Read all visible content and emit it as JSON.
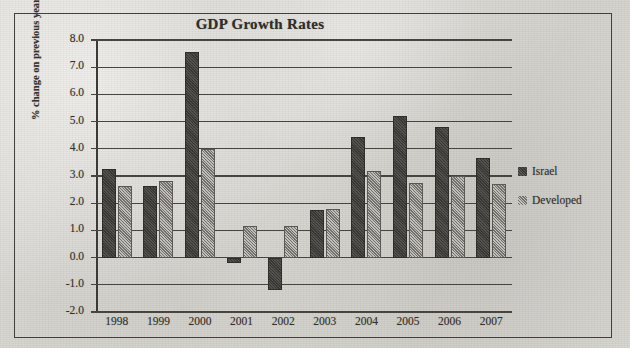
{
  "chart_data": {
    "type": "bar",
    "title": "GDP Growth Rates",
    "xlabel": "",
    "ylabel": "% change on previous year",
    "categories": [
      "1998",
      "1999",
      "2000",
      "2001",
      "2002",
      "2003",
      "2004",
      "2005",
      "2006",
      "2007"
    ],
    "series": [
      {
        "name": "Israel",
        "color": "#312f2b",
        "values": [
          3.25,
          2.65,
          7.55,
          -0.2,
          -1.2,
          1.75,
          4.45,
          5.2,
          4.8,
          3.65
        ]
      },
      {
        "name": "Developed",
        "color": "#8d8a84",
        "values": [
          2.65,
          2.8,
          4.0,
          1.15,
          1.15,
          1.8,
          3.2,
          2.75,
          3.0,
          2.7
        ]
      }
    ],
    "ylim": [
      -2.0,
      8.0
    ],
    "y_ticks": [
      "8.0",
      "7.0",
      "6.0",
      "5.0",
      "4.0",
      "3.0",
      "2.0",
      "1.0",
      "0.0",
      "-1.0",
      "-2.0"
    ],
    "y_tick_values": [
      8.0,
      7.0,
      6.0,
      5.0,
      4.0,
      3.0,
      2.0,
      1.0,
      0.0,
      -1.0,
      -2.0
    ],
    "grid": true,
    "legend_position": "right"
  },
  "legend": {
    "entries": [
      {
        "label": "Israel",
        "swatch": "legend-swatch-israel"
      },
      {
        "label": "Developed",
        "swatch": "legend-swatch-developed"
      }
    ]
  }
}
